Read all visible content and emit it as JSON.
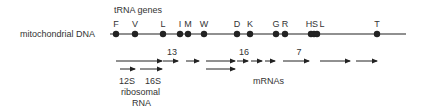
{
  "title": "tRNA genes",
  "dna_label": "mitochondrial DNA",
  "dna_line": {
    "x1": 110,
    "x2": 406,
    "y": 34
  },
  "trna_genes": [
    {
      "label": "F",
      "x": 116,
      "lx": 116
    },
    {
      "label": "V",
      "x": 135,
      "lx": 135
    },
    {
      "label": "L",
      "x": 163,
      "lx": 163
    },
    {
      "label": "I",
      "x": 180,
      "lx": 180
    },
    {
      "label": "M",
      "x": 188,
      "lx": 188
    },
    {
      "label": "W",
      "x": 204,
      "lx": 204
    },
    {
      "label": "D",
      "x": 237,
      "lx": 237
    },
    {
      "label": "K",
      "x": 250,
      "lx": 250
    },
    {
      "label": "G",
      "x": 276,
      "lx": 276
    },
    {
      "label": "R",
      "x": 285,
      "lx": 285
    },
    {
      "label": "H",
      "x": 311,
      "lx": 309
    },
    {
      "label": "S",
      "x": 314,
      "lx": 315
    },
    {
      "label": "L",
      "x": 317,
      "lx": 322
    },
    {
      "label": "T",
      "x": 377,
      "lx": 377
    }
  ],
  "transcripts": {
    "row1": [
      {
        "x1": 116,
        "x2": 162
      },
      {
        "x1": 163,
        "x2": 178
      },
      {
        "x1": 186,
        "x2": 199
      },
      {
        "x1": 206,
        "x2": 235
      },
      {
        "x1": 237,
        "x2": 248
      },
      {
        "x1": 251,
        "x2": 262
      },
      {
        "x1": 265,
        "x2": 275
      },
      {
        "x1": 283,
        "x2": 309
      },
      {
        "x1": 320,
        "x2": 350
      },
      {
        "x1": 356,
        "x2": 377
      }
    ],
    "row2": [
      {
        "x1": 120,
        "x2": 135
      },
      {
        "x1": 140,
        "x2": 162
      },
      {
        "x1": 206,
        "x2": 235
      }
    ]
  },
  "numbers": [
    {
      "label": "13",
      "x": 172,
      "y": 55
    },
    {
      "label": "16",
      "x": 244,
      "y": 55
    },
    {
      "label": "7",
      "x": 299,
      "y": 55
    }
  ],
  "labels": {
    "s12": "12S",
    "s16": "16S",
    "ribosomal": "ribosomal",
    "rna": "RNA",
    "mrnas": "mRNAs"
  },
  "colors": {
    "line": "#222222",
    "text": "#333333"
  }
}
